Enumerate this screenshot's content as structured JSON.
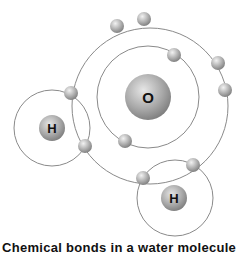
{
  "diagram": {
    "atoms": [
      {
        "id": "oxygen",
        "label": "O"
      },
      {
        "id": "hydrogen-left",
        "label": "H"
      },
      {
        "id": "hydrogen-right",
        "label": "H"
      }
    ],
    "colors": {
      "orbit": "#8a8a8a",
      "electron": "#b0b0b0",
      "nucleus": "#a6a6a6",
      "label": "#111111"
    }
  },
  "caption": "Chemical bonds in a water molecule"
}
